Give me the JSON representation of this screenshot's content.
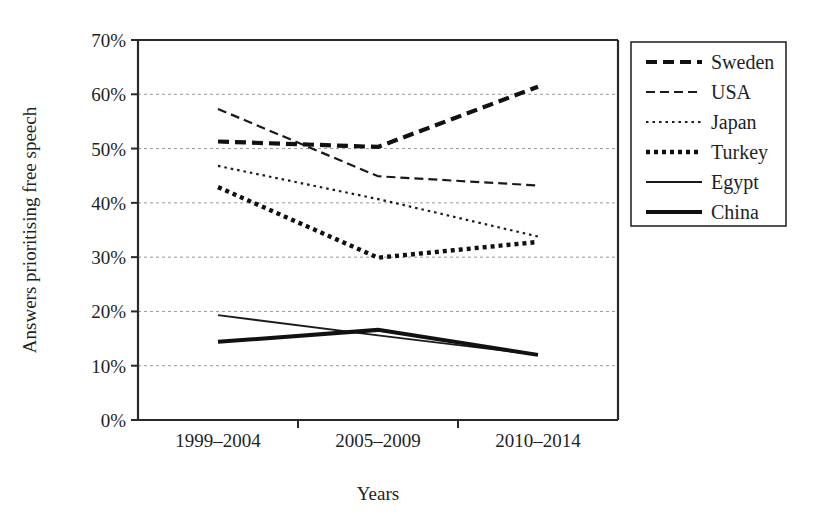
{
  "chart_data": {
    "type": "line",
    "title": "",
    "subtitle": "",
    "xlabel": "Years",
    "ylabel": "Answers prioritising free speech",
    "categories": [
      "1999–2004",
      "2005–2009",
      "2010–2014"
    ],
    "x_tick_labels": [
      "1999–2004",
      "2005–2009",
      "2010–2014"
    ],
    "y_tick_labels": [
      "0%",
      "10%",
      "20%",
      "30%",
      "40%",
      "50%",
      "60%",
      "70%"
    ],
    "y_tick_values": [
      0,
      10,
      20,
      30,
      40,
      50,
      60,
      70
    ],
    "ylim": [
      0,
      70
    ],
    "grid": "horizontal",
    "legend_position": "right",
    "series": [
      {
        "name": "Sweden",
        "values": [
          51.3,
          50.3,
          61.4
        ],
        "line_style": "thick-dashed",
        "color": "#111111",
        "width": 4.2,
        "dash": "11 6"
      },
      {
        "name": "USA",
        "values": [
          57.3,
          44.9,
          43.2
        ],
        "line_style": "dashed",
        "color": "#1a1a1a",
        "width": 2.2,
        "dash": "9 5"
      },
      {
        "name": "Japan",
        "values": [
          46.8,
          40.7,
          33.8
        ],
        "line_style": "fine-dotted",
        "color": "#1a1a1a",
        "width": 2.2,
        "dash": "2.5 4"
      },
      {
        "name": "Turkey",
        "values": [
          42.9,
          29.9,
          32.8
        ],
        "line_style": "thick-dotted",
        "color": "#111111",
        "width": 4.4,
        "dash": "4 4"
      },
      {
        "name": "Egypt",
        "values": [
          19.3,
          15.6,
          12.0
        ],
        "line_style": "thin-solid",
        "color": "#1a1a1a",
        "width": 1.8,
        "dash": "none"
      },
      {
        "name": "China",
        "values": [
          14.4,
          16.6,
          12.0
        ],
        "line_style": "thick-solid",
        "color": "#111111",
        "width": 4.0,
        "dash": "none"
      }
    ],
    "legend_entries": [
      "Sweden",
      "USA",
      "Japan",
      "Turkey",
      "Egypt",
      "China"
    ]
  }
}
